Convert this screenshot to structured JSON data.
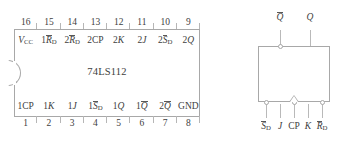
{
  "figure": {
    "kind": "ic-pinout-and-logic-symbol"
  },
  "dip_package": {
    "chip_name": "74LS112",
    "top_pin_numbers": [
      "16",
      "15",
      "14",
      "13",
      "12",
      "11",
      "10",
      "9"
    ],
    "bottom_pin_numbers": [
      "1",
      "2",
      "3",
      "4",
      "5",
      "6",
      "7",
      "8"
    ],
    "top_pin_labels": [
      {
        "base": "V",
        "sub": "CC",
        "overline": false,
        "italic": true,
        "prefix": ""
      },
      {
        "base": "R",
        "sub": "D",
        "overline": true,
        "italic": true,
        "prefix": "1"
      },
      {
        "base": "R",
        "sub": "D",
        "overline": true,
        "italic": true,
        "prefix": "2"
      },
      {
        "base": "CP",
        "sub": "",
        "overline": false,
        "italic": false,
        "prefix": "2"
      },
      {
        "base": "K",
        "sub": "",
        "overline": false,
        "italic": true,
        "prefix": "2"
      },
      {
        "base": "J",
        "sub": "",
        "overline": false,
        "italic": true,
        "prefix": "2"
      },
      {
        "base": "S",
        "sub": "D",
        "overline": true,
        "italic": true,
        "prefix": "2"
      },
      {
        "base": "Q",
        "sub": "",
        "overline": false,
        "italic": true,
        "prefix": "2"
      }
    ],
    "bottom_pin_labels": [
      {
        "base": "CP",
        "sub": "",
        "overline": false,
        "italic": false,
        "prefix": "1"
      },
      {
        "base": "K",
        "sub": "",
        "overline": false,
        "italic": true,
        "prefix": "1"
      },
      {
        "base": "J",
        "sub": "",
        "overline": false,
        "italic": true,
        "prefix": "1"
      },
      {
        "base": "S",
        "sub": "D",
        "overline": true,
        "italic": true,
        "prefix": "1"
      },
      {
        "base": "Q",
        "sub": "",
        "overline": false,
        "italic": true,
        "prefix": "1"
      },
      {
        "base": "Q",
        "sub": "",
        "overline": true,
        "italic": true,
        "prefix": "1"
      },
      {
        "base": "Q",
        "sub": "",
        "overline": true,
        "italic": true,
        "prefix": "2"
      },
      {
        "base": "GND",
        "sub": "",
        "overline": false,
        "italic": false,
        "prefix": ""
      }
    ]
  },
  "logic_symbol": {
    "outputs": [
      {
        "base": "Q",
        "sub": "",
        "overline": true,
        "italic": true,
        "prefix": "",
        "bubble": true
      },
      {
        "base": "Q",
        "sub": "",
        "overline": false,
        "italic": true,
        "prefix": "",
        "bubble": false
      }
    ],
    "inputs": [
      {
        "base": "S",
        "sub": "D",
        "overline": true,
        "italic": true,
        "prefix": "",
        "bubble": true,
        "dynamic": false
      },
      {
        "base": "J",
        "sub": "",
        "overline": false,
        "italic": true,
        "prefix": "",
        "bubble": false,
        "dynamic": false
      },
      {
        "base": "CP",
        "sub": "",
        "overline": false,
        "italic": false,
        "prefix": "",
        "bubble": true,
        "dynamic": true
      },
      {
        "base": "K",
        "sub": "",
        "overline": false,
        "italic": true,
        "prefix": "",
        "bubble": false,
        "dynamic": false
      },
      {
        "base": "R",
        "sub": "D",
        "overline": true,
        "italic": true,
        "prefix": "",
        "bubble": true,
        "dynamic": false
      }
    ]
  },
  "colors": {
    "line": "#a8a8a8",
    "text": "#404040",
    "background": "#ffffff"
  }
}
